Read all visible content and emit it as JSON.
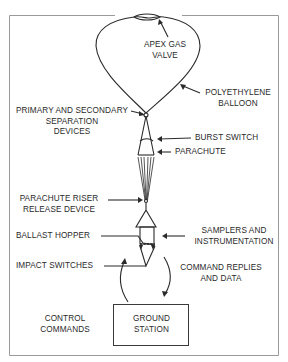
{
  "diagram": {
    "type": "balloon-flight-system",
    "labels": {
      "apex_gas_valve": [
        "APEX GAS",
        "VALVE"
      ],
      "polyethylene_balloon": [
        "POLYETHYLENE",
        "BALLOON"
      ],
      "separation_devices": [
        "PRIMARY AND SECONDARY",
        "SEPARATION",
        "DEVICES"
      ],
      "burst_switch": "BURST SWITCH",
      "parachute": "PARACHUTE",
      "parachute_riser_release": [
        "PARACHUTE RISER",
        "RELEASE DEVICE"
      ],
      "samplers_instrumentation": [
        "SAMPLERS AND",
        "INSTRUMENTATION"
      ],
      "ballast_hopper": "BALLAST HOPPER",
      "impact_switches": "IMPACT SWITCHES",
      "command_replies": [
        "COMMAND REPLIES",
        "AND DATA"
      ],
      "control_commands": [
        "CONTROL",
        "COMMANDS"
      ],
      "ground_station": [
        "GROUND",
        "STATION"
      ]
    },
    "colors": {
      "line": "#2a2a2a",
      "frame": "#9a9a9a",
      "background": "#ffffff"
    }
  }
}
